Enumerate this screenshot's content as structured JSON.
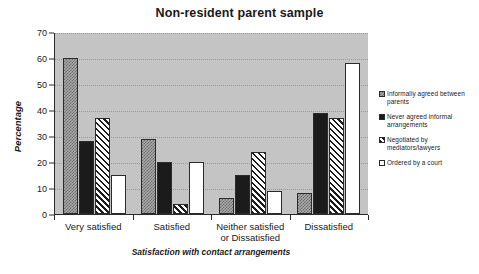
{
  "chart_data": {
    "type": "bar",
    "title": "Non-resident parent sample",
    "xlabel": "Satisfaction with contact arrangements",
    "ylabel": "Percentage",
    "ylim": [
      0,
      70
    ],
    "yticks": [
      0,
      10,
      20,
      30,
      40,
      50,
      60,
      70
    ],
    "grid": true,
    "legend_position": "right",
    "categories": [
      "Very satisfied",
      "Satisfied",
      "Neither satisfied or Dissatisfied",
      "Dissatisfied"
    ],
    "series": [
      {
        "name": "Informally agreed between parents",
        "pattern": "dotted-grey",
        "values": [
          60,
          29,
          6,
          8
        ]
      },
      {
        "name": "Never agreed informal arrangements",
        "pattern": "solid-black",
        "values": [
          28,
          20,
          15,
          39
        ]
      },
      {
        "name": "Negotiated by mediators/lawyers",
        "pattern": "diagonal-hatch",
        "values": [
          37,
          4,
          24,
          37
        ]
      },
      {
        "name": "Ordered by a court",
        "pattern": "white",
        "values": [
          15,
          20,
          9,
          58
        ]
      }
    ]
  },
  "colors": {
    "plot_background": "#c4c4c4",
    "axis": "#2b2b2b",
    "gridline": "#9a9a9a",
    "text": "#1a1a1a",
    "page_background": "#ffffff"
  }
}
